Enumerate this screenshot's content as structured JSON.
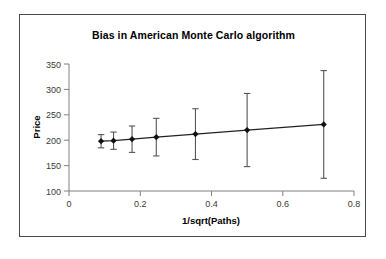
{
  "chart_data": {
    "type": "scatter",
    "title": "Bias in American Monte Carlo algorithm",
    "xlabel": "1/sqrt(Paths)",
    "ylabel": "Price",
    "xlim": [
      0,
      0.8
    ],
    "ylim": [
      100,
      350
    ],
    "xticks": [
      "0",
      "0.2",
      "0.4",
      "0.6",
      "0.8"
    ],
    "xtick_values": [
      0,
      0.2,
      0.4,
      0.6,
      0.8
    ],
    "yticks": [
      "100",
      "150",
      "200",
      "250",
      "300",
      "350"
    ],
    "ytick_values": [
      100,
      150,
      200,
      250,
      300,
      350
    ],
    "grid": false,
    "legend": "none",
    "marker": "diamond",
    "error_bars": "vertical",
    "x": [
      0.09,
      0.125,
      0.177,
      0.245,
      0.355,
      0.5,
      0.715
    ],
    "values": [
      198,
      199,
      202,
      206,
      212,
      220,
      231
    ],
    "yerr": [
      13,
      17,
      26,
      37,
      50,
      72,
      106
    ],
    "series": [
      {
        "name": "Price vs 1/sqrt(Paths)",
        "points": [
          {
            "x": 0.09,
            "y": 198,
            "err": 13,
            "low": 185,
            "high": 211
          },
          {
            "x": 0.125,
            "y": 199,
            "err": 17,
            "low": 182,
            "high": 216
          },
          {
            "x": 0.177,
            "y": 202,
            "err": 26,
            "low": 176,
            "high": 228
          },
          {
            "x": 0.245,
            "y": 206,
            "err": 37,
            "low": 169,
            "high": 243
          },
          {
            "x": 0.355,
            "y": 212,
            "err": 50,
            "low": 162,
            "high": 262
          },
          {
            "x": 0.5,
            "y": 220,
            "err": 72,
            "low": 148,
            "high": 292
          },
          {
            "x": 0.715,
            "y": 231,
            "err": 106,
            "low": 125,
            "high": 337
          }
        ]
      }
    ]
  },
  "colors": {
    "marker": "#111111",
    "line": "#222222",
    "error_bar": "#555555",
    "axis": "#808080",
    "frame": "#4a4a4a",
    "background": "#ffffff",
    "text": "#000000"
  }
}
